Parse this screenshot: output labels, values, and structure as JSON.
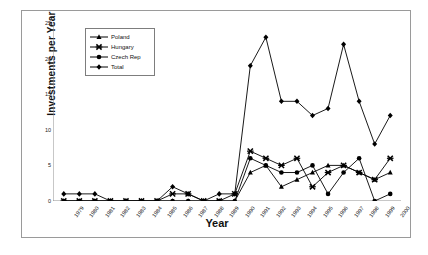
{
  "figure": {
    "x_axis_title": "Year",
    "y_axis_title": "Investments per Year"
  },
  "legend": {
    "position": "upper-left-inside",
    "entries": [
      {
        "label": "Poland",
        "marker": "triangle-marker"
      },
      {
        "label": "Hungary",
        "marker": "x-cross-marker"
      },
      {
        "label": "Czech Rep",
        "marker": "circle-marker"
      },
      {
        "label": "Total",
        "marker": "diamond-marker"
      }
    ]
  },
  "chart_data": {
    "type": "line",
    "title": "",
    "subtitle": "",
    "xlabel": "Year",
    "ylabel": "Investments per Year",
    "xlim": [
      1979,
      2000
    ],
    "ylim": [
      0,
      25
    ],
    "ytick_labels": [
      "0",
      "5",
      "10",
      "15",
      "20",
      "25"
    ],
    "yticks": [
      0,
      5,
      10,
      15,
      20,
      25
    ],
    "grid": false,
    "legend_position": "upper left",
    "categories": [
      "1979",
      "1980",
      "1981",
      "1982",
      "1983",
      "1984",
      "1985",
      "1986",
      "1987",
      "1988",
      "1989",
      "1990",
      "1991",
      "1992",
      "1993",
      "1994",
      "1995",
      "1996",
      "1997",
      "1998",
      "1999",
      "2000"
    ],
    "series": [
      {
        "name": "Poland",
        "marker": "triangle",
        "color": "#000000",
        "values": [
          0,
          0,
          0,
          0,
          0,
          0,
          0,
          0,
          0,
          0,
          0,
          0,
          4,
          5,
          2,
          3,
          4,
          5,
          5,
          4,
          3,
          4
        ]
      },
      {
        "name": "Hungary",
        "marker": "x-cross",
        "color": "#000000",
        "values": [
          0,
          0,
          0,
          0,
          0,
          0,
          0,
          1,
          1,
          0,
          0,
          1,
          7,
          6,
          5,
          6,
          2,
          4,
          5,
          4,
          3,
          6
        ]
      },
      {
        "name": "Czech Rep",
        "marker": "circle",
        "color": "#000000",
        "values": [
          0,
          0,
          0,
          0,
          0,
          0,
          0,
          0,
          0,
          0,
          0,
          0,
          6,
          5,
          4,
          4,
          5,
          1,
          4,
          6,
          0,
          1
        ]
      },
      {
        "name": "Total",
        "marker": "diamond",
        "color": "#000000",
        "values": [
          1,
          1,
          1,
          0,
          0,
          0,
          0,
          2,
          1,
          0,
          1,
          1,
          19,
          23,
          14,
          14,
          12,
          13,
          22,
          14,
          8,
          12
        ]
      }
    ]
  }
}
